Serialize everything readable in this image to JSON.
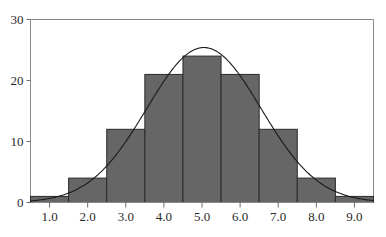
{
  "chart_data": {
    "type": "bar",
    "title": "",
    "subtitle": "",
    "xlabel": "",
    "ylabel": "",
    "categories": [
      "1.0",
      "2.0",
      "3.0",
      "4.0",
      "5.0",
      "6.0",
      "7.0",
      "8.0",
      "9.0"
    ],
    "x": [
      1,
      2,
      3,
      4,
      5,
      6,
      7,
      8,
      9
    ],
    "values": [
      1,
      4,
      12,
      21,
      24,
      21,
      12,
      4,
      1
    ],
    "bin_width": 1,
    "bin_edges": [
      0.5,
      1.5,
      2.5,
      3.5,
      4.5,
      5.5,
      6.5,
      7.5,
      8.5,
      9.5
    ],
    "xlim": [
      0.5,
      9.5
    ],
    "ylim": [
      0,
      30
    ],
    "x_ticks": [
      1,
      2,
      3,
      4,
      5,
      6,
      7,
      8,
      9
    ],
    "x_tick_labels": [
      "1.0",
      "2.0",
      "3.0",
      "4.0",
      "5.0",
      "6.0",
      "7.0",
      "8.0",
      "9.0"
    ],
    "y_ticks": [
      0,
      10,
      20,
      30
    ],
    "y_tick_labels": [
      "0",
      "10",
      "20",
      "30"
    ],
    "grid": false,
    "legend": false,
    "legend_position": "none",
    "bar_color": "#666666",
    "bar_edge_color": "#2b2b2b",
    "overlay": {
      "type": "line",
      "name": "normal-density-curve",
      "color": "#1a1a1a",
      "mean": 5.05,
      "sigma": 1.5,
      "peak_value": 25.4,
      "total_count": 100
    },
    "annotations": []
  }
}
